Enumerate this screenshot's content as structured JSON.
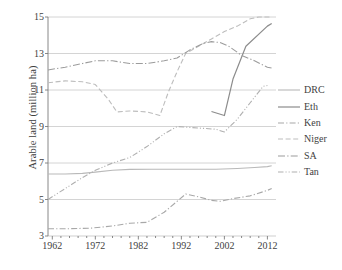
{
  "chart_data": {
    "type": "line",
    "title": "",
    "xlabel": "",
    "ylabel": "Arable land (million ha)",
    "xlim": [
      1961,
      2014
    ],
    "ylim": [
      3,
      15
    ],
    "yticks": [
      3,
      5,
      7,
      9,
      11,
      13,
      15
    ],
    "xticks": [
      1962,
      1972,
      1982,
      1992,
      2002,
      2012
    ],
    "xtick_labels": [
      "1962",
      "1972",
      "1982",
      "1992",
      "2002",
      "2012"
    ],
    "ytick_labels": [
      "3",
      "5",
      "7",
      "9",
      "11",
      "13",
      "15"
    ],
    "grid": "horizontal",
    "legend_position": "right",
    "series": [
      {
        "name": "DRC",
        "color": "#b9b9b9",
        "dash": "none",
        "width": 1.1,
        "x": [
          1961,
          1965,
          1969,
          1972,
          1976,
          1980,
          1985,
          1990,
          1995,
          2000,
          2005,
          2009,
          2012,
          2013
        ],
        "y": [
          6.4,
          6.4,
          6.43,
          6.5,
          6.6,
          6.65,
          6.66,
          6.66,
          6.66,
          6.66,
          6.7,
          6.75,
          6.8,
          6.85
        ]
      },
      {
        "name": "Eth",
        "color": "#8c8c8c",
        "dash": "none",
        "width": 1.2,
        "x": [
          1999,
          2002,
          2004,
          2007,
          2012,
          2013
        ],
        "y": [
          9.82,
          9.6,
          11.6,
          13.4,
          14.5,
          14.65
        ]
      },
      {
        "name": "Ken",
        "color": "#a8a8a8",
        "dash": "dash-dot",
        "width": 1.1,
        "x": [
          1961,
          1966,
          1971,
          1976,
          1980,
          1984,
          1988,
          1991,
          1993,
          1996,
          1999,
          2001,
          2004,
          2008,
          2012,
          2013
        ],
        "y": [
          3.4,
          3.4,
          3.43,
          3.55,
          3.7,
          3.75,
          4.3,
          4.9,
          5.3,
          5.15,
          4.95,
          4.9,
          5.05,
          5.2,
          5.5,
          5.6
        ]
      },
      {
        "name": "Niger",
        "color": "#bdbdbd",
        "dash": "dash",
        "width": 1.1,
        "x": [
          1961,
          1965,
          1969,
          1972,
          1975,
          1977,
          1980,
          1984,
          1987,
          1989,
          1991,
          1993,
          1996,
          1999,
          2002,
          2005,
          2008,
          2010,
          2013
        ],
        "y": [
          11.4,
          11.5,
          11.45,
          11.3,
          10.5,
          9.8,
          9.85,
          9.8,
          9.6,
          10.9,
          12.0,
          13.0,
          13.4,
          13.8,
          14.2,
          14.5,
          14.9,
          15.0,
          15.0
        ]
      },
      {
        "name": "SA",
        "color": "#9c9c9c",
        "dash": "dash-dot-long",
        "width": 1.1,
        "x": [
          1961,
          1965,
          1969,
          1972,
          1976,
          1980,
          1984,
          1988,
          1991,
          1994,
          1997,
          1999,
          2001,
          2003,
          2006,
          2009,
          2012,
          2013
        ],
        "y": [
          12.1,
          12.25,
          12.45,
          12.6,
          12.6,
          12.45,
          12.45,
          12.6,
          12.75,
          13.2,
          13.55,
          13.65,
          13.6,
          13.4,
          12.9,
          12.6,
          12.25,
          12.2
        ]
      },
      {
        "name": "Tan",
        "color": "#b0b0b0",
        "dash": "dash-dot-dot",
        "width": 1.1,
        "x": [
          1961,
          1965,
          1969,
          1972,
          1976,
          1980,
          1984,
          1988,
          1991,
          1994,
          1997,
          2000,
          2002,
          2005,
          2008,
          2011,
          2012
        ],
        "y": [
          5.0,
          5.6,
          6.2,
          6.6,
          7.0,
          7.3,
          7.9,
          8.6,
          9.0,
          8.95,
          8.9,
          8.85,
          8.7,
          9.4,
          10.3,
          11.2,
          11.25
        ]
      }
    ]
  },
  "axes": {
    "ylabel": "Arable land (million ha)"
  },
  "legend": {
    "entries": [
      {
        "label": "DRC"
      },
      {
        "label": "Eth"
      },
      {
        "label": "Ken"
      },
      {
        "label": "Niger"
      },
      {
        "label": "SA"
      },
      {
        "label": "Tan"
      }
    ]
  }
}
